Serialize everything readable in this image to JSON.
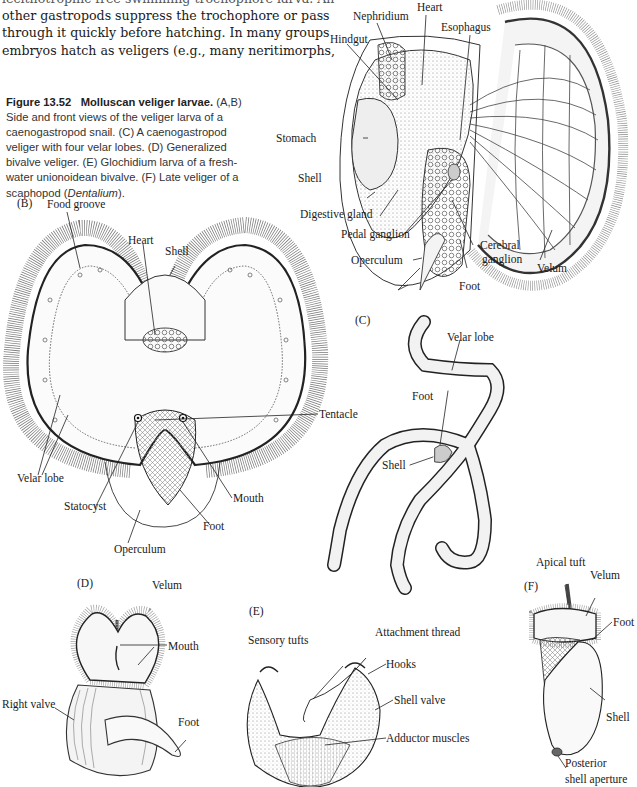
{
  "body_text": {
    "lines": [
      "lecithotrophic free-swimming trochophore larva. An-",
      "other gastropods suppress the trochophore or pass",
      "through it quickly before hatching. In many groups",
      "embryos hatch as veligers (e.g., many neritimorphs,"
    ]
  },
  "figure": {
    "number": "Figure 13.52",
    "title": "Molluscan veliger larvae.",
    "caption_parts": [
      "(A,B) Side and front views of the veliger larva of a caenogastropod snail. (C) A caenogastropod veliger with four velar lobes. (D) Generalized bivalve veliger. (E) Glochidium larva of a fresh-water unionoidean bivalve. (F) Late veliger of a scaphopod (",
      "Dentalium",
      ")."
    ],
    "caption_lines": [
      "(A,B)",
      "Side and front views of the veliger larva of a",
      "caenogastropod snail. (C) A caenogastropod",
      "veliger with four velar lobes. (D) Generalized",
      "bivalve veliger. (E) Glochidium larva of a fresh-",
      "water unionoidean bivalve. (F) Late veliger of a",
      "scaphopod ("
    ],
    "italic_genus": "Dentalium",
    "caption_end": ")."
  },
  "panels": {
    "A": {
      "id": "(A)",
      "labels": {
        "nephridium": "Nephridium",
        "heart": "Heart",
        "hindgut": "Hindgut",
        "esophagus": "Esophagus",
        "stomach": "Stomach",
        "shell": "Shell",
        "digestive_gland": "Digestive gland",
        "pedal_ganglion": "Pedal ganglion",
        "operculum": "Operculum",
        "cerebral_ganglion_1": "Cerebral",
        "cerebral_ganglion_2": "ganglion",
        "foot": "Foot",
        "velum": "Velum"
      }
    },
    "B": {
      "id": "(B)",
      "labels": {
        "food_groove": "Food groove",
        "heart": "Heart",
        "shell": "Shell",
        "tentacle": "Tentacle",
        "velar_lobe": "Velar lobe",
        "statocyst": "Statocyst",
        "mouth": "Mouth",
        "foot": "Foot",
        "operculum": "Operculum"
      }
    },
    "C": {
      "id": "(C)",
      "labels": {
        "velar_lobe": "Velar lobe",
        "foot": "Foot",
        "shell": "Shell"
      }
    },
    "D": {
      "id": "(D)",
      "labels": {
        "velum": "Velum",
        "mouth": "Mouth",
        "right_valve": "Right valve",
        "foot": "Foot"
      }
    },
    "E": {
      "id": "(E)",
      "labels": {
        "sensory_tufts": "Sensory tufts",
        "attachment_thread": "Attachment thread",
        "hooks": "Hooks",
        "shell_valve": "Shell valve",
        "adductor_muscles": "Adductor muscles"
      }
    },
    "F": {
      "id": "(F)",
      "labels": {
        "apical_tuft": "Apical tuft",
        "velum": "Velum",
        "foot": "Foot",
        "shell": "Shell",
        "posterior_1": "Posterior",
        "posterior_2": "shell aperture"
      }
    }
  }
}
